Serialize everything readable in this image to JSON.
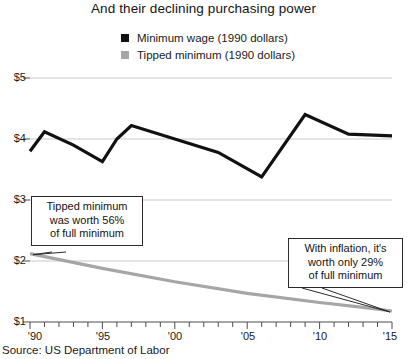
{
  "header": {
    "subtitle": "And their declining purchasing power"
  },
  "legend": {
    "position": "top-center",
    "items": [
      {
        "label": "Minimum wage (1990 dollars)",
        "color": "#111111",
        "marker": "square"
      },
      {
        "label": "Tipped minimum (1990 dollars)",
        "color": "#a6a6a6",
        "marker": "square"
      }
    ]
  },
  "axes": {
    "y_ticks": [
      "$1",
      "$2",
      "$3",
      "$4",
      "$5"
    ],
    "x_ticks": [
      "'90",
      "'95",
      "'00",
      "'05",
      "'10",
      "'15"
    ]
  },
  "annotations": {
    "tipped": {
      "line1": "Tipped minimum",
      "line2": "was worth 56%",
      "line3": "of full minimum"
    },
    "inflation": {
      "line1": "With inflation, it's",
      "line2": "worth only 29%",
      "line3": "of full minimum"
    }
  },
  "footer": {
    "source": "Source: US Department of Labor"
  },
  "chart_data": {
    "type": "line",
    "title": "And their declining purchasing power",
    "xlabel": "",
    "ylabel": "",
    "xlim": [
      1990,
      2015
    ],
    "ylim": [
      1,
      5
    ],
    "grid": true,
    "y_tick_values": [
      1,
      2,
      3,
      4,
      5
    ],
    "y_tick_labels": [
      "$1",
      "$2",
      "$3",
      "$4",
      "$5"
    ],
    "x_tick_values": [
      1990,
      1995,
      2000,
      2005,
      2010,
      2015
    ],
    "x_tick_labels": [
      "'90",
      "'95",
      "'00",
      "'05",
      "'10",
      "'15"
    ],
    "x_minor_tick_step": 1,
    "legend_position": "top-center",
    "series": [
      {
        "name": "Minimum wage (1990 dollars)",
        "color": "#111111",
        "x": [
          1990,
          1991,
          1993,
          1995,
          1996,
          1997,
          2000,
          2003,
          2006,
          2009,
          2012,
          2015
        ],
        "values": [
          3.8,
          4.12,
          3.9,
          3.63,
          4.0,
          4.22,
          4.0,
          3.78,
          3.38,
          4.4,
          4.08,
          4.05
        ]
      },
      {
        "name": "Tipped minimum (1990 dollars)",
        "color": "#a6a6a6",
        "x": [
          1990,
          1995,
          2000,
          2005,
          2010,
          2013,
          2015
        ],
        "values": [
          2.12,
          1.88,
          1.66,
          1.47,
          1.32,
          1.24,
          1.18
        ]
      }
    ],
    "annotations": [
      {
        "text": "Tipped minimum was worth 56% of full minimum",
        "points_to_x": 1990,
        "points_to_y": 2.12
      },
      {
        "text": "With inflation, it's worth only 29% of full minimum",
        "points_to_x": 2015,
        "points_to_y": 1.18
      }
    ]
  }
}
